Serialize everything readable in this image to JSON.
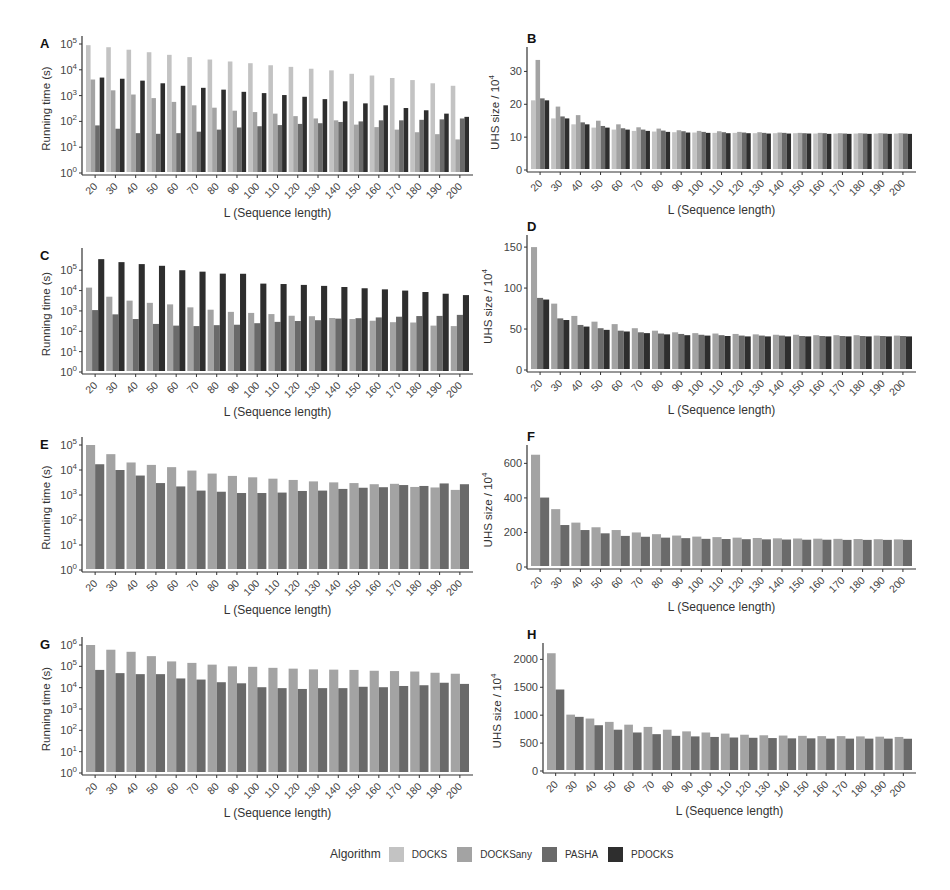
{
  "legend": {
    "title": "Algorithm",
    "items": [
      {
        "name": "DOCKS",
        "color": "#c3c3c3"
      },
      {
        "name": "DOCKSany",
        "color": "#a3a3a3"
      },
      {
        "name": "PASHA",
        "color": "#6a6a6a"
      },
      {
        "name": "PDOCKS",
        "color": "#2e2e2e"
      }
    ]
  },
  "chart_data": [
    {
      "panel": "A",
      "type": "bar",
      "scale": "log",
      "title": "",
      "xlabel": "L (Sequence length)",
      "ylabel": "Running time (s)",
      "ylim": [
        1,
        100000
      ],
      "yticks": [
        "10^0",
        "10^1",
        "10^2",
        "10^3",
        "10^4",
        "10^5"
      ],
      "categories": [
        "20",
        "30",
        "40",
        "50",
        "60",
        "70",
        "80",
        "90",
        "100",
        "110",
        "120",
        "130",
        "140",
        "150",
        "160",
        "170",
        "180",
        "190",
        "200"
      ],
      "series": [
        {
          "name": "DOCKS",
          "values": [
            90000,
            75000,
            60000,
            48000,
            38000,
            31000,
            25000,
            21000,
            18000,
            15000,
            13000,
            11000,
            9500,
            7000,
            6000,
            4800,
            4000,
            3000,
            2400
          ]
        },
        {
          "name": "DOCKSany",
          "values": [
            4200,
            1600,
            1100,
            800,
            570,
            420,
            340,
            260,
            230,
            200,
            160,
            130,
            110,
            75,
            60,
            48,
            38,
            32,
            20
          ]
        },
        {
          "name": "PASHA",
          "values": [
            70,
            52,
            35,
            33,
            35,
            40,
            48,
            58,
            65,
            72,
            80,
            85,
            95,
            100,
            110,
            110,
            115,
            120,
            130
          ]
        },
        {
          "name": "PDOCKS",
          "values": [
            5000,
            4500,
            3800,
            3000,
            2400,
            2000,
            1700,
            1400,
            1250,
            1050,
            900,
            730,
            600,
            500,
            420,
            330,
            270,
            200,
            150
          ]
        }
      ]
    },
    {
      "panel": "B",
      "type": "bar",
      "scale": "linear",
      "title": "",
      "xlabel": "L (Sequence length)",
      "ylabel": "UHS size / 10^4",
      "ylim": [
        0,
        35
      ],
      "yticks": [
        "0",
        "10",
        "20",
        "30"
      ],
      "categories": [
        "20",
        "30",
        "40",
        "50",
        "60",
        "70",
        "80",
        "90",
        "100",
        "110",
        "120",
        "130",
        "140",
        "150",
        "160",
        "170",
        "180",
        "190",
        "200"
      ],
      "series": [
        {
          "name": "DOCKS",
          "values": [
            21.2,
            15.7,
            13.9,
            12.9,
            12.3,
            11.9,
            11.7,
            11.5,
            11.4,
            11.3,
            11.3,
            11.2,
            11.2,
            11.2,
            11.1,
            11.1,
            11.1,
            11.1,
            11.1
          ]
        },
        {
          "name": "DOCKSany",
          "values": [
            33.5,
            19.3,
            16.7,
            15.0,
            13.9,
            13.0,
            12.6,
            12.1,
            11.9,
            11.8,
            11.6,
            11.5,
            11.4,
            11.3,
            11.3,
            11.2,
            11.2,
            11.2,
            11.2
          ]
        },
        {
          "name": "PASHA",
          "values": [
            21.8,
            16.3,
            14.5,
            13.4,
            12.7,
            12.3,
            12.0,
            11.8,
            11.6,
            11.5,
            11.4,
            11.3,
            11.3,
            11.2,
            11.2,
            11.1,
            11.1,
            11.1,
            11.1
          ]
        },
        {
          "name": "PDOCKS",
          "values": [
            21.2,
            15.7,
            13.9,
            12.9,
            12.3,
            11.9,
            11.6,
            11.4,
            11.3,
            11.2,
            11.2,
            11.1,
            11.1,
            11.1,
            11.0,
            11.0,
            11.0,
            11.0,
            11.0
          ]
        }
      ]
    },
    {
      "panel": "C",
      "type": "bar",
      "scale": "log",
      "title": "",
      "xlabel": "L (Sequence length)",
      "ylabel": "Running time (s)",
      "ylim": [
        1,
        500000
      ],
      "yticks": [
        "10^0",
        "10^1",
        "10^2",
        "10^3",
        "10^4",
        "10^5"
      ],
      "categories": [
        "20",
        "30",
        "40",
        "50",
        "60",
        "70",
        "80",
        "90",
        "100",
        "110",
        "120",
        "130",
        "140",
        "150",
        "160",
        "170",
        "180",
        "190",
        "200"
      ],
      "series": [
        {
          "name": "DOCKSany",
          "values": [
            14000,
            5000,
            3200,
            2500,
            2100,
            1500,
            1150,
            900,
            800,
            700,
            580,
            550,
            450,
            400,
            330,
            280,
            270,
            190,
            180
          ]
        },
        {
          "name": "PASHA",
          "values": [
            1100,
            680,
            400,
            230,
            190,
            180,
            200,
            210,
            250,
            290,
            320,
            350,
            420,
            440,
            480,
            520,
            560,
            570,
            640
          ]
        },
        {
          "name": "PDOCKS",
          "values": [
            350000,
            250000,
            200000,
            165000,
            100000,
            85000,
            68000,
            67000,
            22000,
            21000,
            19000,
            17000,
            15000,
            13000,
            11500,
            10000,
            8500,
            7000,
            6000
          ]
        }
      ]
    },
    {
      "panel": "D",
      "type": "bar",
      "scale": "linear",
      "title": "",
      "xlabel": "L (Sequence length)",
      "ylabel": "UHS size / 10^4",
      "ylim": [
        0,
        155
      ],
      "yticks": [
        "0",
        "50",
        "100",
        "150"
      ],
      "categories": [
        "20",
        "30",
        "40",
        "50",
        "60",
        "70",
        "80",
        "90",
        "100",
        "110",
        "120",
        "130",
        "140",
        "150",
        "160",
        "170",
        "180",
        "190",
        "200"
      ],
      "series": [
        {
          "name": "DOCKSany",
          "values": [
            150,
            81,
            66,
            59,
            56,
            51,
            48,
            46,
            45,
            44.5,
            44,
            43.5,
            43,
            43,
            42.5,
            42.5,
            42.5,
            42,
            42
          ]
        },
        {
          "name": "PASHA",
          "values": [
            88,
            63,
            55,
            51,
            48,
            46,
            44.5,
            44,
            43,
            42.5,
            42,
            42,
            42,
            41.5,
            41.5,
            41.5,
            41.5,
            41.5,
            41.5
          ]
        },
        {
          "name": "PDOCKS",
          "values": [
            86,
            61,
            53,
            49,
            47,
            45,
            43.5,
            42.5,
            42,
            41.5,
            41,
            41,
            41,
            41,
            41,
            41,
            41,
            41,
            41
          ]
        }
      ]
    },
    {
      "panel": "E",
      "type": "bar",
      "scale": "log",
      "title": "",
      "xlabel": "L (Sequence length)",
      "ylabel": "Running time (s)",
      "ylim": [
        1,
        100000
      ],
      "yticks": [
        "10^0",
        "10^1",
        "10^2",
        "10^3",
        "10^4",
        "10^5"
      ],
      "categories": [
        "20",
        "30",
        "40",
        "50",
        "60",
        "70",
        "80",
        "90",
        "100",
        "110",
        "120",
        "130",
        "140",
        "150",
        "160",
        "170",
        "180",
        "190",
        "200"
      ],
      "series": [
        {
          "name": "DOCKSany",
          "values": [
            100000,
            43000,
            20000,
            16000,
            13000,
            9500,
            7200,
            5800,
            5100,
            4500,
            4000,
            3500,
            3200,
            3000,
            2700,
            2800,
            2100,
            2000,
            1600
          ]
        },
        {
          "name": "PASHA",
          "values": [
            17000,
            10000,
            6000,
            3000,
            2200,
            1500,
            1350,
            1200,
            1200,
            1250,
            1450,
            1500,
            1750,
            1950,
            2050,
            2500,
            2300,
            2900,
            2700
          ]
        }
      ]
    },
    {
      "panel": "F",
      "type": "bar",
      "scale": "linear",
      "title": "",
      "xlabel": "L (Sequence length)",
      "ylabel": "UHS size / 10^4",
      "ylim": [
        0,
        660
      ],
      "yticks": [
        "0",
        "200",
        "400",
        "600"
      ],
      "categories": [
        "20",
        "30",
        "40",
        "50",
        "60",
        "70",
        "80",
        "90",
        "100",
        "110",
        "120",
        "130",
        "140",
        "150",
        "160",
        "170",
        "180",
        "190",
        "200"
      ],
      "series": [
        {
          "name": "DOCKSany",
          "values": [
            650,
            335,
            257,
            230,
            214,
            200,
            190,
            182,
            176,
            173,
            170,
            168,
            166,
            165,
            164,
            163,
            162,
            161,
            160
          ]
        },
        {
          "name": "PASHA",
          "values": [
            402,
            243,
            214,
            195,
            180,
            175,
            170,
            167,
            163,
            162,
            161,
            160,
            159,
            158,
            158,
            157,
            157,
            157,
            157
          ]
        }
      ]
    },
    {
      "panel": "G",
      "type": "bar",
      "scale": "log",
      "title": "",
      "xlabel": "L (Sequence length)",
      "ylabel": "Running time (s)",
      "ylim": [
        1,
        1000000
      ],
      "yticks": [
        "10^0",
        "10^1",
        "10^2",
        "10^3",
        "10^4",
        "10^5",
        "10^6"
      ],
      "categories": [
        "20",
        "30",
        "40",
        "50",
        "60",
        "70",
        "80",
        "90",
        "100",
        "110",
        "120",
        "130",
        "140",
        "150",
        "160",
        "170",
        "180",
        "190",
        "200"
      ],
      "series": [
        {
          "name": "DOCKSany",
          "values": [
            1000000,
            600000,
            480000,
            300000,
            170000,
            145000,
            120000,
            100000,
            95000,
            85000,
            78000,
            72000,
            70000,
            68000,
            62000,
            60000,
            57000,
            50000,
            45000
          ]
        },
        {
          "name": "PASHA",
          "values": [
            68000,
            48000,
            43000,
            43000,
            27000,
            24000,
            18000,
            16000,
            10500,
            9500,
            8700,
            9500,
            9500,
            11000,
            10500,
            12000,
            13000,
            17000,
            15000
          ]
        }
      ]
    },
    {
      "panel": "H",
      "type": "bar",
      "scale": "linear",
      "title": "",
      "xlabel": "L (Sequence length)",
      "ylabel": "UHS size / 10^4",
      "ylim": [
        0,
        2150
      ],
      "yticks": [
        "0",
        "500",
        "1000",
        "1500",
        "2000"
      ],
      "categories": [
        "20",
        "30",
        "40",
        "50",
        "60",
        "70",
        "80",
        "90",
        "100",
        "110",
        "120",
        "130",
        "140",
        "150",
        "160",
        "170",
        "180",
        "190",
        "200"
      ],
      "series": [
        {
          "name": "DOCKSany",
          "values": [
            2110,
            1010,
            940,
            880,
            830,
            790,
            740,
            710,
            690,
            670,
            650,
            640,
            635,
            630,
            625,
            625,
            620,
            615,
            610
          ]
        },
        {
          "name": "PASHA",
          "values": [
            1460,
            970,
            820,
            740,
            690,
            660,
            630,
            620,
            610,
            600,
            595,
            590,
            585,
            585,
            580,
            580,
            580,
            580,
            578
          ]
        }
      ]
    }
  ]
}
